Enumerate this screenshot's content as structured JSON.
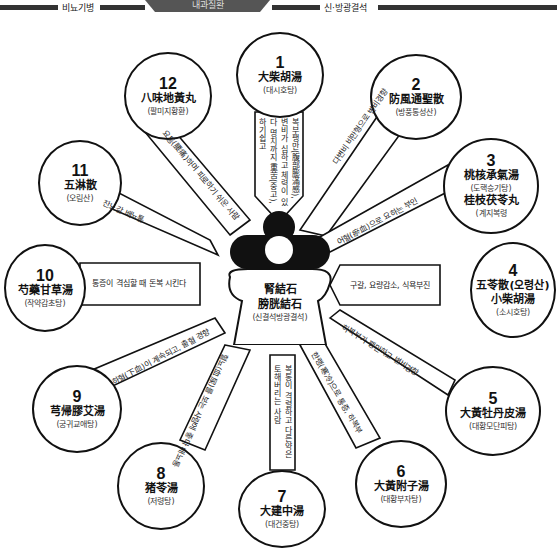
{
  "header": {
    "left_section": "비뇨기병",
    "center_title": "내과질환",
    "right_section": "신·방광결석"
  },
  "center": {
    "line1": "腎結石",
    "line2": "膀胱結石",
    "reading": "(신결석방광결석)"
  },
  "nodes": [
    {
      "num": "1",
      "hanja": "大柴胡湯",
      "reading": "(대시호탕)"
    },
    {
      "num": "2",
      "hanja": "防風通聖散",
      "reading": "(방풍통성산)"
    },
    {
      "num": "3",
      "hanja": "桃核承氣湯",
      "reading": "(도핵승기탕)",
      "hanja2": "桂枝茯苓丸",
      "reading2": "(계지복령"
    },
    {
      "num": "4",
      "hanja": "五苓散(오령산)",
      "hanja2": "小柴胡湯",
      "reading2": "(소시호탕)"
    },
    {
      "num": "5",
      "hanja": "大黃牡丹皮湯",
      "reading": "(대황모단피탕)"
    },
    {
      "num": "6",
      "hanja": "大黃附子湯",
      "reading": "(대황부자탕)"
    },
    {
      "num": "7",
      "hanja": "大建中湯",
      "reading": "(대건중탕)"
    },
    {
      "num": "8",
      "hanja": "猪苓湯",
      "reading": "(저령탕)"
    },
    {
      "num": "9",
      "hanja": "芎帰膠艾湯",
      "reading": "(궁귀교애탕)"
    },
    {
      "num": "10",
      "hanja": "芍藥甘草湯",
      "reading": "(작약감초탕)"
    },
    {
      "num": "11",
      "hanja": "五淋散",
      "reading": "(오림산)"
    },
    {
      "num": "12",
      "hanja": "八味地黃丸",
      "reading": "(팔미지황환)"
    }
  ],
  "notes": {
    "n1": "복부팽만(腹部膨滿感), 변비가 심하고 체력이 있다 명치까지 重苦(중고), 하기쉽고",
    "n2": "다변비 비만형으로 변비경향",
    "n3": "어혈(瘀血)으로 요하는 부인",
    "n4": "구갈, 요량감소, 식욕부진",
    "n5": "하복부가 팽만하고 변비경향",
    "n6": "한랭(寒冷)으로 통증, 하복부",
    "n7": "복통이 격렬하고 다른약은 토해버리는 사람",
    "n8": "혈뇨(血尿)를 보는 사람에 좋다 배뇨통",
    "n9": "하혈(下血)이 계속되고, 출혈 경향",
    "n10": "통증이 격심할 때 돈복 시킨다",
    "n11": "잔뇨감 배뇨통",
    "n12": "요통(腰痛)하며 피로하기 쉬운 사람"
  }
}
